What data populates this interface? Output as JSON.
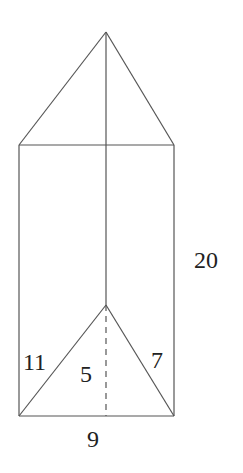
{
  "diagram": {
    "type": "triangular-prism",
    "labels": {
      "height": "20",
      "left_edge": "11",
      "altitude": "5",
      "right_edge": "7",
      "base": "9"
    },
    "stroke_color": "#555555",
    "background": "#ffffff"
  }
}
